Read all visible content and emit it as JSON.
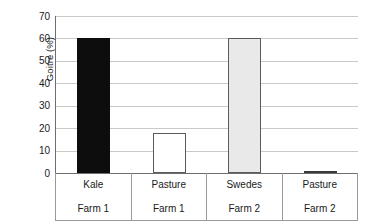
{
  "chart_data": {
    "type": "bar",
    "title": "",
    "subtitle": "",
    "xlabel": "",
    "ylabel": "Goitre (%)",
    "categories": [
      "Kale",
      "Pasture",
      "Swedes",
      "Pasture"
    ],
    "group_labels": [
      "Farm 1",
      "Farm 1",
      "Farm 2",
      "Farm 2"
    ],
    "values": [
      60,
      18,
      60,
      1
    ],
    "ylim": [
      0,
      70
    ],
    "ytick_labels": [
      "70",
      "60",
      "50",
      "40",
      "30",
      "20",
      "10",
      "0"
    ],
    "ytick_values": [
      70,
      60,
      50,
      40,
      30,
      20,
      10,
      0
    ],
    "grid": true,
    "legend": "none",
    "bar_styles": [
      "black",
      "white",
      "gray",
      "dark"
    ],
    "colors": {
      "bar_black": "#0d0d0d",
      "bar_white": "#ffffff",
      "bar_gray": "#e9e9e9",
      "bar_dark": "#3a3a3a",
      "bar_outline": "#5a5a5a",
      "gridline": "#c9c9c9",
      "axis": "#6e6e6e",
      "table_border": "#9a9a9a",
      "background": "#ffffff",
      "text": "#1a1a1a"
    }
  }
}
